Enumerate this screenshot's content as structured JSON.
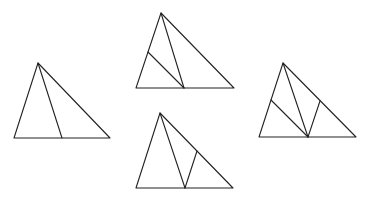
{
  "diagram": {
    "stroke_color": "#222222",
    "background": "#ffffff",
    "triangles": [
      {
        "id": "triangle-1",
        "vertices": [
          [
            38,
            63
          ],
          [
            14,
            138
          ],
          [
            110,
            138
          ]
        ],
        "segments": [
          [
            [
              38,
              63
            ],
            [
              62,
              138
            ]
          ]
        ]
      },
      {
        "id": "triangle-2",
        "vertices": [
          [
            161,
            13
          ],
          [
            136,
            88
          ],
          [
            234,
            88
          ]
        ],
        "segments": [
          [
            [
              161,
              13
            ],
            [
              184,
              88
            ]
          ],
          [
            [
              184,
              88
            ],
            [
              148,
              52
            ]
          ]
        ]
      },
      {
        "id": "triangle-3",
        "vertices": [
          [
            160,
            113
          ],
          [
            136,
            188
          ],
          [
            233,
            188
          ]
        ],
        "segments": [
          [
            [
              160,
              113
            ],
            [
              185,
              188
            ]
          ],
          [
            [
              185,
              188
            ],
            [
              197,
              151
            ]
          ]
        ]
      },
      {
        "id": "triangle-4",
        "vertices": [
          [
            283,
            63
          ],
          [
            259,
            137
          ],
          [
            356,
            137
          ]
        ],
        "segments": [
          [
            [
              283,
              63
            ],
            [
              308,
              137
            ]
          ],
          [
            [
              308,
              137
            ],
            [
              271,
              100
            ]
          ],
          [
            [
              308,
              137
            ],
            [
              320,
              101
            ]
          ]
        ]
      }
    ]
  }
}
